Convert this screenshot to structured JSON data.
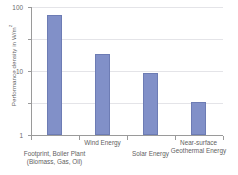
{
  "chart_data": {
    "type": "bar",
    "title": "",
    "xlabel": "",
    "ylabel": "Performance density in W/m",
    "ylabel_superscript": "2",
    "yscale": "log",
    "ylim": [
      0.01,
      100
    ],
    "ytick_labels": [
      "100",
      "10",
      "1",
      "0.1",
      "0.01"
    ],
    "ytick_values": [
      100,
      10,
      1,
      0.1,
      0.01
    ],
    "grid": true,
    "legend": "none",
    "bar_color": "#8190C8",
    "categories": [
      "Footprint, Boiler Plant\n(Biomass, Gas, Oil)",
      "Wind Energy",
      "Solar Energy",
      "Near-surface\nGeothermal Energy"
    ],
    "values": [
      55,
      3.3,
      0.85,
      0.105
    ],
    "units": "W/m²"
  },
  "axis": {
    "y_title_text": "Performance density in W/m",
    "y_title_sup": "2",
    "ticks": [
      {
        "label": "100",
        "value": 100
      },
      {
        "label": "10",
        "value": 10
      },
      {
        "label": "1",
        "value": 1
      },
      {
        "label": "0.1",
        "value": 0.1
      },
      {
        "label": "0.01",
        "value": 0.01
      }
    ]
  },
  "categories": [
    {
      "label": "Footprint, Boiler Plant\n(Biomass, Gas, Oil)",
      "value": 55
    },
    {
      "label": "Wind Energy",
      "value": 3.3
    },
    {
      "label": "Solar Energy",
      "value": 0.85
    },
    {
      "label": "Near-surface\nGeothermal Energy",
      "value": 0.105
    }
  ]
}
